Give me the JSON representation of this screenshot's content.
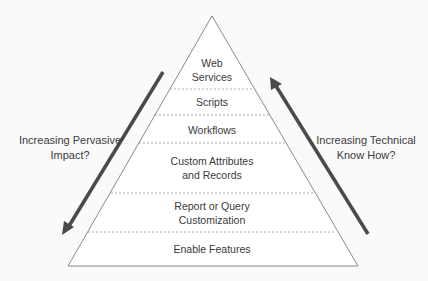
{
  "diagram": {
    "type": "pyramid",
    "levels": [
      {
        "label_line1": "Web",
        "label_line2": "Services"
      },
      {
        "label_line1": "Scripts"
      },
      {
        "label_line1": "Workflows"
      },
      {
        "label_line1": "Custom Attributes",
        "label_line2": "and Records"
      },
      {
        "label_line1": "Report or Query",
        "label_line2": "Customization"
      },
      {
        "label_line1": "Enable Features"
      }
    ],
    "left_arrow": {
      "line1": "Increasing Pervasive",
      "line2": "Impact?",
      "direction": "down"
    },
    "right_arrow": {
      "line1": "Increasing Technical",
      "line2": "Know How?",
      "direction": "up"
    },
    "colors": {
      "outline": "#8a8a8a",
      "divider": "#9a9a9a",
      "arrow": "#4a4a4a",
      "text": "#3a3a3a"
    }
  }
}
